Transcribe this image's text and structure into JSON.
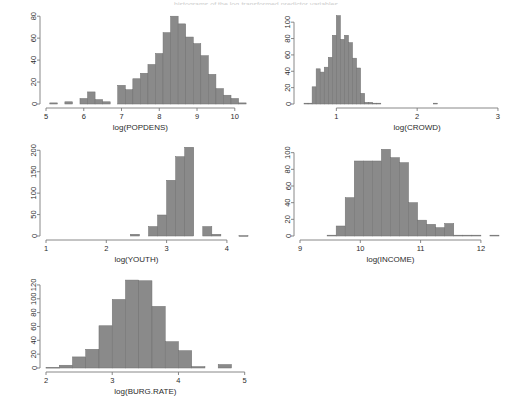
{
  "figure": {
    "clipped_top_caption": "histograms of the log-transformed predictor variables",
    "bar_color": "#8a8a8a",
    "bar_border_color": "#6f6f6f",
    "axis_color": "#7a7a7a",
    "text_color": "#2b2b2b",
    "background": "#ffffff"
  },
  "chart_data": [
    {
      "type": "bar",
      "id": "popdens",
      "title": "",
      "xlabel": "log(POPDENS)",
      "ylabel": "",
      "xlim": [
        5,
        10.35
      ],
      "ylim": [
        0,
        82
      ],
      "xticks": [
        5,
        6,
        7,
        8,
        9,
        10
      ],
      "xtick_labels": [
        "5",
        "6",
        "7",
        "8",
        "9",
        "10"
      ],
      "yticks": [
        0,
        20,
        40,
        60,
        80
      ],
      "ytick_labels": [
        "0",
        "20",
        "40",
        "60",
        "80"
      ],
      "grid": false,
      "bin_width": 0.2,
      "bin_starts": [
        5.1,
        5.3,
        5.5,
        5.7,
        5.9,
        6.1,
        6.3,
        6.5,
        6.7,
        6.9,
        7.1,
        7.3,
        7.5,
        7.7,
        7.9,
        8.1,
        8.3,
        8.5,
        8.7,
        8.9,
        9.1,
        9.3,
        9.5,
        9.7,
        9.9,
        10.1
      ],
      "values": [
        1,
        0,
        2,
        0,
        5,
        11,
        4,
        2,
        0,
        17,
        13,
        23,
        28,
        36,
        46,
        65,
        80,
        73,
        61,
        55,
        44,
        27,
        14,
        8,
        5,
        1
      ]
    },
    {
      "type": "bar",
      "id": "crowd",
      "title": "",
      "xlabel": "log(CROWD)",
      "ylabel": "",
      "xlim": [
        0.55,
        3.05
      ],
      "ylim": [
        0,
        110
      ],
      "xticks": [
        1,
        2,
        3
      ],
      "xtick_labels": [
        "1",
        "2",
        "3"
      ],
      "yticks": [
        0,
        20,
        40,
        60,
        80,
        100
      ],
      "ytick_labels": [
        "0",
        "20",
        "40",
        "60",
        "80",
        "100"
      ],
      "grid": false,
      "bin_width": 0.05,
      "bin_starts": [
        0.6,
        0.65,
        0.7,
        0.75,
        0.8,
        0.85,
        0.9,
        0.95,
        1.0,
        1.05,
        1.1,
        1.15,
        1.2,
        1.25,
        1.3,
        1.35,
        1.4,
        1.45,
        1.5,
        1.55,
        1.6,
        1.65,
        1.7,
        2.2
      ],
      "values": [
        1,
        1,
        21,
        43,
        39,
        45,
        57,
        84,
        108,
        79,
        84,
        75,
        56,
        44,
        13,
        2,
        2,
        1,
        1,
        0,
        0,
        0,
        0,
        1
      ]
    },
    {
      "type": "bar",
      "id": "youth",
      "title": "",
      "xlabel": "log(YOUTH)",
      "ylabel": "",
      "xlim": [
        1,
        4.35
      ],
      "ylim": [
        0,
        210
      ],
      "xticks": [
        1,
        2,
        3,
        4
      ],
      "xtick_labels": [
        "1",
        "2",
        "3",
        "4"
      ],
      "yticks": [
        0,
        50,
        100,
        150,
        200
      ],
      "ytick_labels": [
        "0",
        "50",
        "100",
        "150",
        "200"
      ],
      "grid": false,
      "bin_width": 0.15,
      "bin_starts": [
        2.4,
        2.55,
        2.7,
        2.85,
        3.0,
        3.15,
        3.3,
        3.45,
        3.6,
        3.75,
        4.2
      ],
      "values": [
        4,
        0,
        22,
        49,
        130,
        185,
        207,
        0,
        22,
        4,
        1
      ]
    },
    {
      "type": "bar",
      "id": "income",
      "title": "",
      "xlabel": "log(INCOME)",
      "ylabel": "",
      "xlim": [
        9,
        12.35
      ],
      "ylim": [
        0,
        108
      ],
      "xticks": [
        9,
        10,
        11,
        12
      ],
      "xtick_labels": [
        "9",
        "10",
        "11",
        "12"
      ],
      "yticks": [
        0,
        20,
        40,
        60,
        80,
        100
      ],
      "ytick_labels": [
        "0",
        "20",
        "40",
        "60",
        "80",
        "100"
      ],
      "grid": false,
      "bin_width": 0.15,
      "bin_starts": [
        9.45,
        9.6,
        9.75,
        9.9,
        10.05,
        10.2,
        10.35,
        10.5,
        10.65,
        10.8,
        10.95,
        11.1,
        11.25,
        11.4,
        11.55,
        11.7,
        11.85,
        12.0,
        12.15
      ],
      "values": [
        1,
        12,
        46,
        90,
        90,
        90,
        104,
        94,
        88,
        40,
        19,
        14,
        10,
        15,
        1,
        1,
        1,
        0,
        1
      ]
    },
    {
      "type": "bar",
      "id": "burgrate",
      "title": "",
      "xlabel": "log(BURG.RATE)",
      "ylabel": "",
      "xlim": [
        2,
        5.05
      ],
      "ylim": [
        0,
        130
      ],
      "xticks": [
        2,
        3,
        4,
        5
      ],
      "xtick_labels": [
        "2",
        "3",
        "4",
        "5"
      ],
      "yticks": [
        0,
        20,
        40,
        60,
        80,
        100,
        120
      ],
      "ytick_labels": [
        "0",
        "20",
        "40",
        "60",
        "80",
        "100",
        "120"
      ],
      "grid": false,
      "bin_width": 0.2,
      "bin_starts": [
        2.0,
        2.2,
        2.4,
        2.6,
        2.8,
        3.0,
        3.2,
        3.4,
        3.6,
        3.8,
        4.0,
        4.2,
        4.6
      ],
      "values": [
        1,
        4,
        16,
        27,
        61,
        99,
        127,
        126,
        89,
        38,
        25,
        2,
        5,
        1
      ]
    }
  ]
}
